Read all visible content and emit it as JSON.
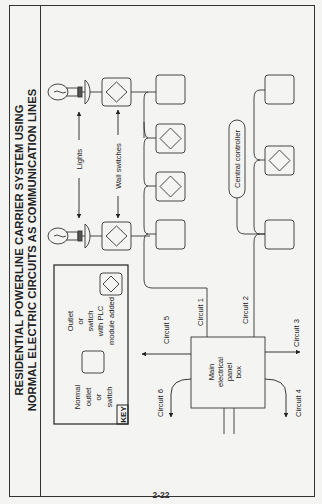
{
  "title": {
    "line1": "RESIDENTIAL POWERLINE CARRIER SYSTEM USING",
    "line2": "NORMAL ELECTRIC CIRCUITS AS COMMUNICATION LINES"
  },
  "labels": {
    "lights": "Lights",
    "wall_switches": "Wall switches",
    "central_controller": "Central controller",
    "panel_line1": "Main",
    "panel_line2": "electrical",
    "panel_line3": "panel",
    "panel_line4": "box"
  },
  "circuits": {
    "c1": "Circuit 1",
    "c2": "Circuit 2",
    "c3": "Circuit 3",
    "c4": "Circuit 4",
    "c5": "Circuit 5",
    "c6": "Circuit 6"
  },
  "key": {
    "tag": "KEY",
    "normal_line1": "Normal",
    "normal_line2": "outlet",
    "normal_line3": "or",
    "normal_line4": "switch",
    "plc_line1": "Outlet",
    "plc_line2": "or",
    "plc_line3": "switch",
    "plc_line4": "with PLC",
    "plc_line5": "module added"
  },
  "page_number": "2-22",
  "colors": {
    "background": "#f4f4f2",
    "ink": "#222222"
  }
}
